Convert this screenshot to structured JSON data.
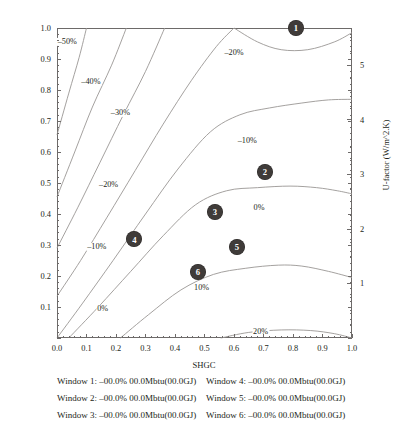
{
  "chart_data": {
    "type": "line",
    "title": "",
    "xlabel": "SHGC",
    "ylabel": "U-factor (Btu/hr.ft^2.F)",
    "ylabel_secondary": "U-factor (W/m^2.K)",
    "xlim": [
      0.0,
      1.0
    ],
    "ylim": [
      0.0,
      1.0
    ],
    "ylim_secondary": [
      0.0,
      5.678
    ],
    "grid": false,
    "legend_position": "below-plot",
    "xticks": [
      "0.0",
      "0.1",
      "0.2",
      "0.3",
      "0.4",
      "0.5",
      "0.6",
      "0.7",
      "0.8",
      "0.9",
      "1.0"
    ],
    "xtick_values": [
      0.0,
      0.1,
      0.2,
      0.3,
      0.4,
      0.5,
      0.6,
      0.7,
      0.8,
      0.9,
      1.0
    ],
    "yticks": [
      "0.1",
      "0.2",
      "0.3",
      "0.4",
      "0.5",
      "0.6",
      "0.7",
      "0.8",
      "0.9",
      "1.0"
    ],
    "ytick_values": [
      0.1,
      0.2,
      0.3,
      0.4,
      0.5,
      0.6,
      0.7,
      0.8,
      0.9,
      1.0
    ],
    "yticks_right": [
      "1",
      "2",
      "3",
      "4",
      "5"
    ],
    "ytick_right_values": [
      1,
      2,
      3,
      4,
      5
    ],
    "contour_levels": [
      -50,
      -40,
      -30,
      -20,
      -10,
      0,
      10,
      20
    ],
    "contour_labels": [
      {
        "text": "‒50%",
        "x": 0.035,
        "y": 0.955
      },
      {
        "text": "‒40%",
        "x": 0.115,
        "y": 0.825
      },
      {
        "text": "‒30%",
        "x": 0.215,
        "y": 0.725
      },
      {
        "text": "‒20%",
        "x": 0.175,
        "y": 0.495
      },
      {
        "text": "‒20%",
        "x": 0.6,
        "y": 0.92
      },
      {
        "text": "‒10%",
        "x": 0.135,
        "y": 0.295
      },
      {
        "text": "‒10%",
        "x": 0.645,
        "y": 0.635
      },
      {
        "text": "0%",
        "x": 0.155,
        "y": 0.095
      },
      {
        "text": "0%",
        "x": 0.685,
        "y": 0.42
      },
      {
        "text": "10%",
        "x": 0.49,
        "y": 0.16
      },
      {
        "text": "20%",
        "x": 0.69,
        "y": 0.018
      }
    ],
    "markers": [
      {
        "label": "1",
        "x": 0.81,
        "y": 1.0
      },
      {
        "label": "2",
        "x": 0.705,
        "y": 0.537
      },
      {
        "label": "3",
        "x": 0.535,
        "y": 0.408
      },
      {
        "label": "4",
        "x": 0.262,
        "y": 0.318
      },
      {
        "label": "5",
        "x": 0.61,
        "y": 0.295
      },
      {
        "label": "6",
        "x": 0.478,
        "y": 0.212
      }
    ],
    "series": [
      {
        "name": "‒50%",
        "points": [
          [
            0.0,
            0.655
          ],
          [
            0.04,
            0.79
          ],
          [
            0.075,
            0.905
          ],
          [
            0.1,
            1.0
          ]
        ]
      },
      {
        "name": "‒40%",
        "points": [
          [
            0.0,
            0.455
          ],
          [
            0.06,
            0.6
          ],
          [
            0.12,
            0.745
          ],
          [
            0.185,
            0.88
          ],
          [
            0.235,
            1.0
          ]
        ]
      },
      {
        "name": "‒30%",
        "points": [
          [
            0.0,
            0.29
          ],
          [
            0.07,
            0.42
          ],
          [
            0.145,
            0.565
          ],
          [
            0.225,
            0.72
          ],
          [
            0.3,
            0.86
          ],
          [
            0.365,
            1.0
          ]
        ]
      },
      {
        "name": "‒20%",
        "points": [
          [
            0.0,
            0.135
          ],
          [
            0.08,
            0.25
          ],
          [
            0.17,
            0.39
          ],
          [
            0.265,
            0.54
          ],
          [
            0.36,
            0.69
          ],
          [
            0.455,
            0.83
          ],
          [
            0.54,
            0.94
          ],
          [
            0.6,
            1.0
          ]
        ]
      },
      {
        "name": "‒20%-upper",
        "points": [
          [
            0.6,
            1.0
          ],
          [
            0.68,
            0.955
          ],
          [
            0.76,
            0.93
          ],
          [
            0.85,
            0.93
          ],
          [
            0.94,
            0.955
          ],
          [
            1.0,
            0.985
          ]
        ]
      },
      {
        "name": "‒10%",
        "points": [
          [
            0.0,
            0.0
          ],
          [
            0.085,
            0.11
          ],
          [
            0.19,
            0.25
          ],
          [
            0.3,
            0.4
          ],
          [
            0.41,
            0.545
          ],
          [
            0.52,
            0.665
          ],
          [
            0.62,
            0.72
          ],
          [
            0.72,
            0.742
          ],
          [
            0.83,
            0.758
          ],
          [
            0.92,
            0.768
          ],
          [
            1.0,
            0.77
          ]
        ]
      },
      {
        "name": "0%",
        "points": [
          [
            0.04,
            0.0
          ],
          [
            0.14,
            0.1
          ],
          [
            0.25,
            0.215
          ],
          [
            0.36,
            0.33
          ],
          [
            0.47,
            0.43
          ],
          [
            0.575,
            0.475
          ],
          [
            0.68,
            0.485
          ],
          [
            0.79,
            0.49
          ],
          [
            0.88,
            0.485
          ],
          [
            0.95,
            0.475
          ],
          [
            1.0,
            0.465
          ]
        ]
      },
      {
        "name": "10%",
        "points": [
          [
            0.215,
            0.0
          ],
          [
            0.31,
            0.075
          ],
          [
            0.42,
            0.155
          ],
          [
            0.53,
            0.205
          ],
          [
            0.64,
            0.225
          ],
          [
            0.75,
            0.235
          ],
          [
            0.83,
            0.232
          ],
          [
            0.92,
            0.215
          ],
          [
            1.0,
            0.195
          ]
        ]
      },
      {
        "name": "20%",
        "points": [
          [
            0.555,
            0.0
          ],
          [
            0.65,
            0.018
          ],
          [
            0.76,
            0.026
          ],
          [
            0.86,
            0.024
          ],
          [
            0.94,
            0.014
          ],
          [
            1.0,
            0.0
          ]
        ]
      }
    ]
  },
  "legend": {
    "rows": [
      {
        "left": "Window 1: ‒00.0% 00.0Mbtu(00.0GJ)",
        "right": "Window 4: ‒00.0% 00.0Mbtu(00.0GJ)"
      },
      {
        "left": "Window 2: ‒00.0% 00.0Mbtu(00.0GJ)",
        "right": "Window 5: ‒00.0% 00.0Mbtu(00.0GJ)"
      },
      {
        "left": "Window 3: ‒00.0% 00.0Mbtu(00.0GJ)",
        "right": "Window 6: ‒00.0% 00.0Mbtu(00.0GJ)"
      }
    ]
  },
  "colors": {
    "contour_line": "#9a9694",
    "frame": "#6d6a69",
    "marker_fill": "#3f3b39",
    "marker_text": "#ffffff",
    "text": "#231f20"
  }
}
